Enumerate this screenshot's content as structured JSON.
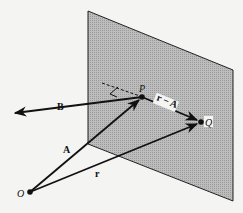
{
  "diagram": {
    "type": "vector-geometry",
    "colors": {
      "background": "#f4f4f2",
      "plane_fill": "#b4b4b4",
      "line": "#111111"
    },
    "labels": {
      "origin": "O",
      "point_p": "P",
      "point_q": "Q",
      "vector_a": "A",
      "vector_r": "r",
      "vector_b": "B",
      "vector_r_minus_a": "r − A"
    },
    "points": {
      "O": [
        30,
        192
      ],
      "P": [
        142,
        97
      ],
      "Q": [
        201,
        122
      ]
    },
    "plane_corners": [
      [
        88,
        11
      ],
      [
        233,
        70
      ],
      [
        233,
        201
      ],
      [
        88,
        144
      ]
    ]
  }
}
